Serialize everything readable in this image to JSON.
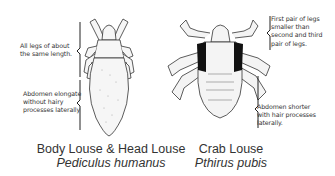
{
  "left_specimen": {
    "common_name": "Body Louse & Head Louse",
    "scientific_name": "Pediculus humanus",
    "annotations": [
      {
        "line1": "All legs of about",
        "line2": "the same length."
      },
      {
        "line1": "Abdomen elongate",
        "line2": "without hairy",
        "line3": "processes laterally"
      }
    ]
  },
  "right_specimen": {
    "common_name": "Crab Louse",
    "scientific_name": "Pthirus pubis",
    "annotations": [
      {
        "line1": "First pair of legs",
        "line2": "smaller than",
        "line3": "second and third",
        "line4": "pair of legs."
      },
      {
        "line1": "Abdomen shorter",
        "line2": "with hair processes",
        "line3": "laterally."
      }
    ]
  },
  "colors": {
    "ink": "#222222",
    "body_fill": "#f4f4f4",
    "dark_patch": "#111111"
  }
}
